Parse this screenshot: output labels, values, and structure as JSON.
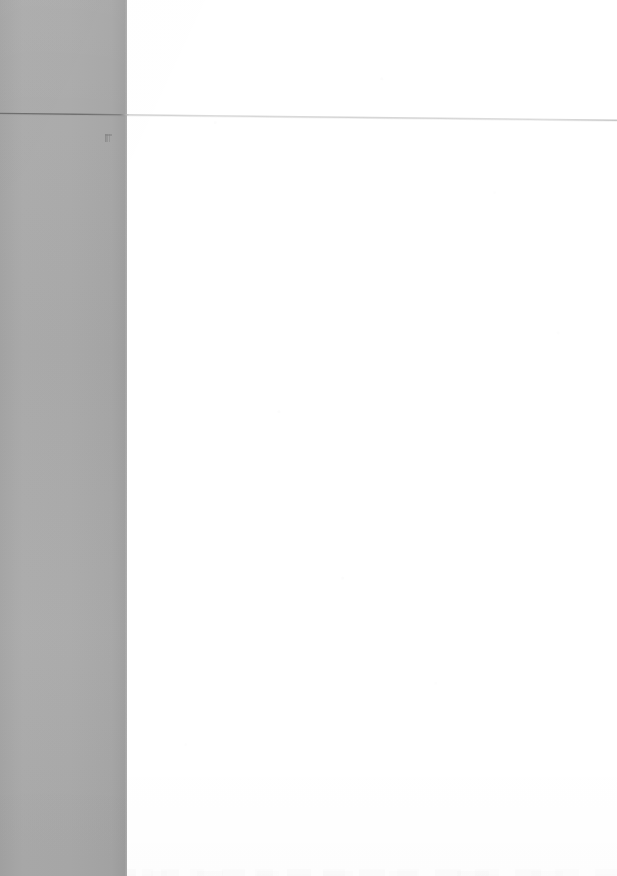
{
  "document": {
    "type": "scanned-page",
    "title": "Scanned blank page",
    "page_content_text": "",
    "body_text": "",
    "visible_text_count": 0,
    "notes": "blank page scan; no legible text rendered"
  },
  "canvas": {
    "width_px": 617,
    "height_px": 876,
    "background_color": "#ffffff"
  },
  "gutter": {
    "label": "scanner shadow band",
    "color": "#a9a9a9",
    "x_px": 0,
    "width_px": 127,
    "height_px": 876
  },
  "page_body": {
    "label": "page surface",
    "color": "#ffffff",
    "x_px": 127,
    "width_px": 490,
    "height_px": 876
  },
  "header_rule": {
    "label": "horizontal rule",
    "color_on_white": "#d9d9d9",
    "color_on_gray": "#7c7c7c",
    "left_y_px": 113,
    "right_y_px": 120,
    "thickness_px": 1
  },
  "artifacts": {
    "smudge": {
      "label": "ink smudge",
      "x_px": 105,
      "y_px": 134,
      "width_px": 7,
      "height_px": 8
    },
    "bleed_through": {
      "label": "bleed-through ghost text",
      "y_px": 854,
      "height_px": 22,
      "color": "#f2f2f2"
    }
  }
}
